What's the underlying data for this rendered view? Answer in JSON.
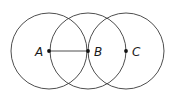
{
  "diagram": {
    "stroke_color": "#3a3a3a",
    "point_color": "#111111",
    "radius": 38,
    "points": [
      {
        "label": "A",
        "x": 49,
        "y": 51
      },
      {
        "label": "B",
        "x": 88,
        "y": 51
      },
      {
        "label": "C",
        "x": 126,
        "y": 51
      }
    ],
    "circles": [
      {
        "center": "A",
        "cx": 49,
        "cy": 51
      },
      {
        "center": "B",
        "cx": 88,
        "cy": 51
      },
      {
        "center": "C",
        "cx": 126,
        "cy": 51
      }
    ],
    "segments": [
      {
        "from": "A",
        "to": "B"
      }
    ]
  }
}
